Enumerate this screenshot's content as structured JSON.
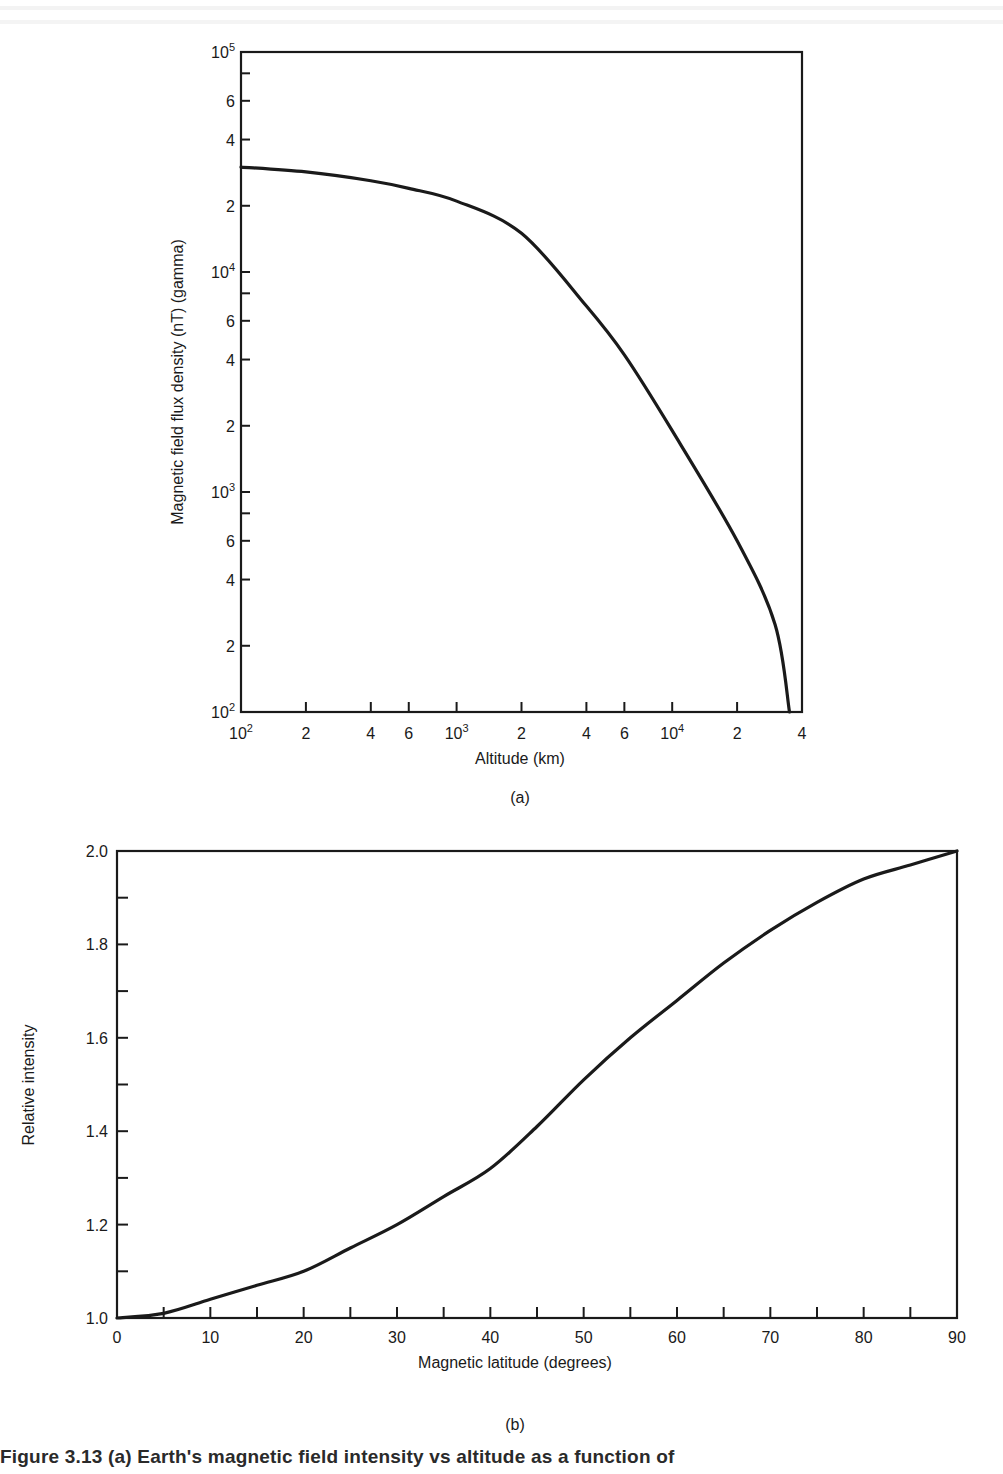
{
  "figure": {
    "panel_a_label": "(a)",
    "panel_b_label": "(b)",
    "caption": "Figure 3.13  (a) Earth's magnetic field intensity vs altitude as a function of"
  },
  "chart_data": [
    {
      "type": "line",
      "panel": "(a)",
      "title": "",
      "xlabel": "Altitude (km)",
      "ylabel": "Magnetic field flux density (nT) (gamma)",
      "xscale": "log",
      "yscale": "log",
      "xlim": [
        100,
        40000
      ],
      "ylim": [
        100,
        100000
      ],
      "grid": false,
      "x_tick_labels": [
        "10^2",
        "2",
        "4",
        "6",
        "10^3",
        "2",
        "4",
        "6",
        "10^4",
        "2",
        "4"
      ],
      "x_ticks": [
        100,
        200,
        400,
        600,
        1000,
        2000,
        4000,
        6000,
        10000,
        20000,
        40000
      ],
      "y_tick_labels": [
        "10^2",
        "2",
        "4",
        "6",
        "10^3",
        "2",
        "4",
        "6",
        "10^4",
        "2",
        "4",
        "6",
        "10^5"
      ],
      "y_ticks": [
        100,
        200,
        400,
        600,
        1000,
        2000,
        4000,
        6000,
        10000,
        20000,
        40000,
        60000,
        100000
      ],
      "series": [
        {
          "name": "Field intensity",
          "x": [
            100,
            200,
            400,
            600,
            1000,
            2000,
            4000,
            6000,
            10000,
            20000,
            30000,
            35000
          ],
          "y": [
            30000,
            28500,
            26000,
            24000,
            21000,
            15000,
            7000,
            4200,
            1900,
            600,
            250,
            100
          ]
        }
      ]
    },
    {
      "type": "line",
      "panel": "(b)",
      "title": "",
      "xlabel": "Magnetic latitude (degrees)",
      "ylabel": "Relative intensity",
      "xlim": [
        0,
        90
      ],
      "ylim": [
        1.0,
        2.0
      ],
      "grid": false,
      "x_tick_labels": [
        "0",
        "10",
        "20",
        "30",
        "40",
        "50",
        "60",
        "70",
        "80",
        "90"
      ],
      "x_minor_step": 5,
      "y_tick_labels": [
        "1.0",
        "1.2",
        "1.4",
        "1.6",
        "1.8",
        "2.0"
      ],
      "y_minor_step": 0.1,
      "series": [
        {
          "name": "Relative intensity",
          "x": [
            0,
            5,
            10,
            15,
            20,
            25,
            30,
            35,
            40,
            45,
            50,
            55,
            60,
            65,
            70,
            75,
            80,
            85,
            90
          ],
          "y": [
            1.0,
            1.01,
            1.04,
            1.07,
            1.1,
            1.15,
            1.2,
            1.26,
            1.32,
            1.41,
            1.51,
            1.6,
            1.68,
            1.76,
            1.83,
            1.89,
            1.94,
            1.97,
            2.0
          ]
        }
      ]
    }
  ]
}
